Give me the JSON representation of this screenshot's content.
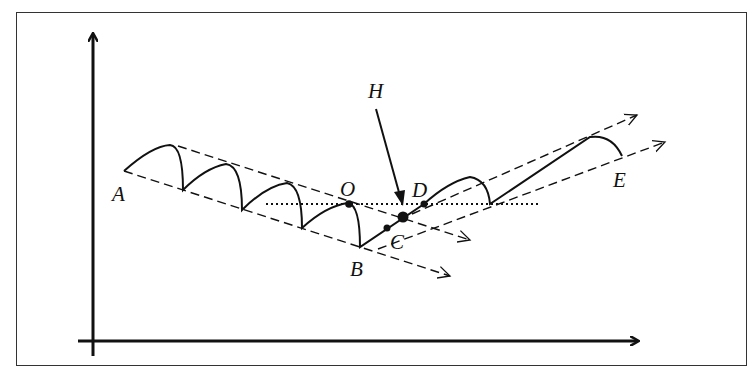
{
  "diagram": {
    "type": "price-trend-channel",
    "colors": {
      "line": "#111111",
      "background": "#ffffff",
      "frame": "#333333"
    },
    "labels": [
      {
        "id": "A",
        "text": "A",
        "x": 112,
        "y": 201
      },
      {
        "id": "B",
        "text": "B",
        "x": 350,
        "y": 276
      },
      {
        "id": "C",
        "text": "C",
        "x": 390,
        "y": 249
      },
      {
        "id": "D",
        "text": "D",
        "x": 412,
        "y": 197
      },
      {
        "id": "E",
        "text": "E",
        "x": 613,
        "y": 187
      },
      {
        "id": "O",
        "text": "O",
        "x": 340,
        "y": 196
      },
      {
        "id": "H",
        "text": "H",
        "x": 368,
        "y": 98
      }
    ],
    "axes": {
      "x_axis": "horizontal arrow",
      "y_axis": "vertical arrow"
    },
    "elements": [
      "descending channel (dashed, from A to B)",
      "ascending channel (dashed, from B to E)",
      "dotted horizontal level line through O and D",
      "arrow from H pointing to breakout level",
      "points O, C, D and intersection dot"
    ]
  }
}
